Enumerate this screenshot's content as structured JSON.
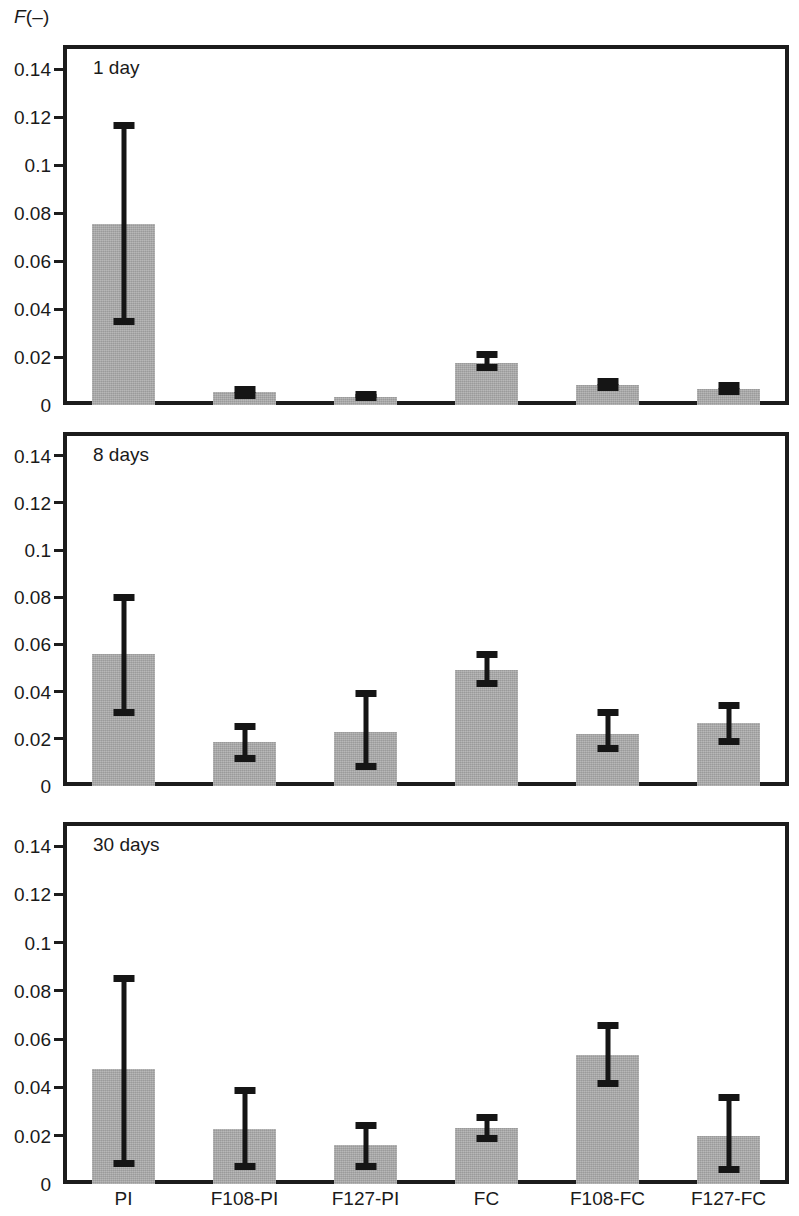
{
  "figure": {
    "y_axis_caption_italic": "F",
    "y_axis_caption_rest": "(–)",
    "bar_color": "#a9a9a9",
    "error_bar_color": "#151515",
    "frame_color": "#1c1c1c"
  },
  "chart_data": {
    "type": "bar",
    "title": "",
    "subtitle": "",
    "xlabel": "",
    "ylabel": "F(–)",
    "ylim": [
      0,
      0.15
    ],
    "yticks": [
      0,
      0.02,
      0.04,
      0.06,
      0.08,
      0.1,
      0.12,
      0.14
    ],
    "ytick_labels": [
      "0",
      "0.02",
      "0.04",
      "0.06",
      "0.08",
      "0.1",
      "0.12",
      "0.14"
    ],
    "grid": false,
    "legend": "none",
    "categories": [
      "PI",
      "F108-PI",
      "F127-PI",
      "FC",
      "F108-FC",
      "F127-FC"
    ],
    "panels": [
      {
        "annotation": "1 day",
        "values": [
          0.0755,
          0.0053,
          0.0035,
          0.0175,
          0.0083,
          0.0065
        ],
        "err_low": [
          0.0335,
          0.0025,
          0.0015,
          0.014,
          0.006,
          0.004
        ],
        "err_high": [
          0.118,
          0.0078,
          0.0058,
          0.0225,
          0.0112,
          0.0095
        ]
      },
      {
        "annotation": "8 days",
        "values": [
          0.0558,
          0.0185,
          0.023,
          0.0492,
          0.0222,
          0.0267
        ],
        "err_low": [
          0.0298,
          0.0103,
          0.0068,
          0.042,
          0.0145,
          0.0175
        ],
        "err_high": [
          0.0812,
          0.0265,
          0.0405,
          0.0572,
          0.0325,
          0.0355
        ]
      },
      {
        "annotation": "30 days",
        "values": [
          0.0475,
          0.0228,
          0.016,
          0.0232,
          0.0533,
          0.0198
        ],
        "err_low": [
          0.007,
          0.0058,
          0.006,
          0.0175,
          0.0403,
          0.0045
        ],
        "err_high": [
          0.0868,
          0.04,
          0.0255,
          0.029,
          0.0672,
          0.0375
        ]
      }
    ]
  }
}
